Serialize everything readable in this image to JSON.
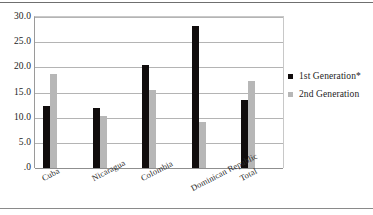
{
  "chart_data": {
    "type": "bar",
    "title": "",
    "subtitle": "",
    "xlabel": "",
    "ylabel": "",
    "categories": [
      "Cuba",
      "Nicaragua",
      "Colombia",
      "Dominican Republic",
      "Total"
    ],
    "series": [
      {
        "name": "1st Generation*",
        "color": "#100c0c",
        "values": [
          12.4,
          12.0,
          20.4,
          28.2,
          13.5
        ]
      },
      {
        "name": "2nd Generation",
        "color": "#b7b7b7",
        "values": [
          18.6,
          10.3,
          15.5,
          9.2,
          17.3
        ]
      }
    ],
    "ylim": [
      0,
      30
    ],
    "ytick_values": [
      0,
      5,
      10,
      15,
      20,
      25,
      30
    ],
    "ytick_labels": [
      ".0",
      "5.0",
      "10.0",
      "15.0",
      "20.0",
      "25.0",
      "30.0"
    ],
    "grid": "horizontal",
    "legend_position": "right",
    "annotations": []
  },
  "legend": {
    "entries": [
      {
        "label": "1st Generation*",
        "color": "#100c0c"
      },
      {
        "label": "2nd Generation",
        "color": "#b7b7b7"
      }
    ]
  },
  "colors": {
    "series1": "#100c0c",
    "series2": "#b7b7b7",
    "gridline": "#b4b4b4",
    "axis": "#8f8f8f",
    "background": "#ffffff"
  }
}
